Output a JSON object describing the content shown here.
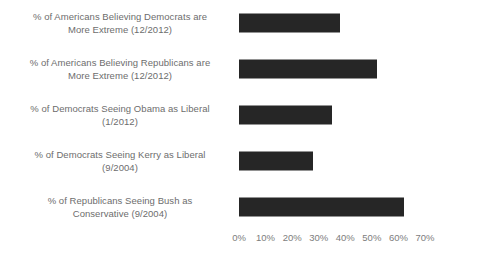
{
  "chart_data": {
    "type": "bar",
    "orientation": "horizontal",
    "title": "",
    "xlabel": "",
    "ylabel": "",
    "grid": false,
    "legend": false,
    "xlim": [
      0,
      70
    ],
    "xunit": "%",
    "xticks": [
      "0%",
      "10%",
      "20%",
      "30%",
      "40%",
      "50%",
      "60%",
      "70%"
    ],
    "xtick_values": [
      0,
      10,
      20,
      30,
      40,
      50,
      60,
      70
    ],
    "categories": [
      "% of Americans Believing Democrats are More Extreme (12/2012)",
      "% of Americans Believing Republicans are More Extreme (12/2012)",
      "% of Democrats Seeing Obama as Liberal (1/2012)",
      "% of Democrats Seeing Kerry as Liberal (9/2004)",
      "% of Republicans Seeing Bush as Conservative (9/2004)"
    ],
    "values": [
      38,
      52,
      35,
      28,
      62
    ],
    "bar_color": "#262626"
  },
  "labels": {
    "line1": [
      "% of Americans Believing Democrats are",
      "More Extreme (12/2012)"
    ],
    "line2": [
      "% of Americans Believing Republicans are",
      "More Extreme (12/2012)"
    ],
    "line3": [
      "% of Democrats Seeing Obama as Liberal",
      "(1/2012)"
    ],
    "line4": [
      "% of Democrats Seeing Kerry as Liberal",
      "(9/2004)"
    ],
    "line5": [
      "% of Republicans Seeing Bush as",
      "Conservative (9/2004)"
    ]
  }
}
